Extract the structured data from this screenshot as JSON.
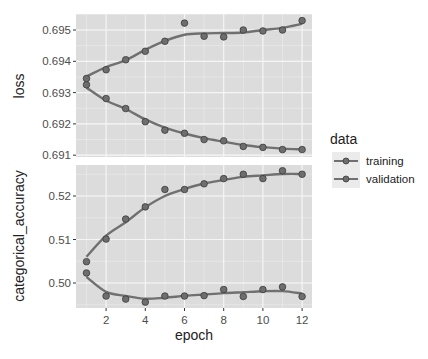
{
  "chart_data": {
    "type": "line",
    "title": "",
    "x": [
      1,
      2,
      3,
      4,
      5,
      6,
      7,
      8,
      9,
      10,
      11,
      12
    ],
    "xlabel": "epoch",
    "xticks": [
      2,
      4,
      6,
      8,
      10,
      12
    ],
    "legend": {
      "title": "data",
      "entries": [
        "training",
        "validation"
      ],
      "position": "right"
    },
    "grid": true,
    "panels": [
      {
        "ylabel": "loss",
        "yticks": [
          "0.691",
          "0.692",
          "0.693",
          "0.694",
          "0.695"
        ],
        "ylim": [
          0.691,
          0.6956
        ],
        "series": [
          {
            "name": "training",
            "values": [
              0.69325,
              0.69281,
              0.69249,
              0.69207,
              0.6918,
              0.6917,
              0.6915,
              0.69146,
              0.69128,
              0.69125,
              0.69118,
              0.69118
            ]
          },
          {
            "name": "validation",
            "values": [
              0.69345,
              0.69373,
              0.69405,
              0.69432,
              0.69464,
              0.69522,
              0.6948,
              0.69478,
              0.695,
              0.69497,
              0.695,
              0.6953
            ]
          }
        ]
      },
      {
        "ylabel": "categorical_accuracy",
        "yticks": [
          "0.50",
          "0.51",
          "0.52"
        ],
        "ylim": [
          0.4943,
          0.5272
        ],
        "series": [
          {
            "name": "training",
            "values": [
              0.5049,
              0.5101,
              0.5147,
              0.5175,
              0.5215,
              0.5215,
              0.5228,
              0.524,
              0.525,
              0.524,
              0.5258,
              0.525
            ]
          },
          {
            "name": "validation",
            "values": [
              0.5023,
              0.497,
              0.4963,
              0.4956,
              0.497,
              0.497,
              0.4971,
              0.4985,
              0.4969,
              0.4985,
              0.4991,
              0.4969
            ]
          }
        ]
      }
    ]
  },
  "labels": {
    "xlabel": "epoch",
    "ylabel_top": "loss",
    "ylabel_bottom": "categorical_accuracy",
    "legend_title": "data",
    "legend_training": "training",
    "legend_validation": "validation"
  },
  "colors": {
    "panel_bg": "#dcdcdc",
    "grid": "#f5f5f5",
    "line": "#707070",
    "point_fill": "#6e6e6e",
    "point_stroke": "#3a3a3a"
  }
}
